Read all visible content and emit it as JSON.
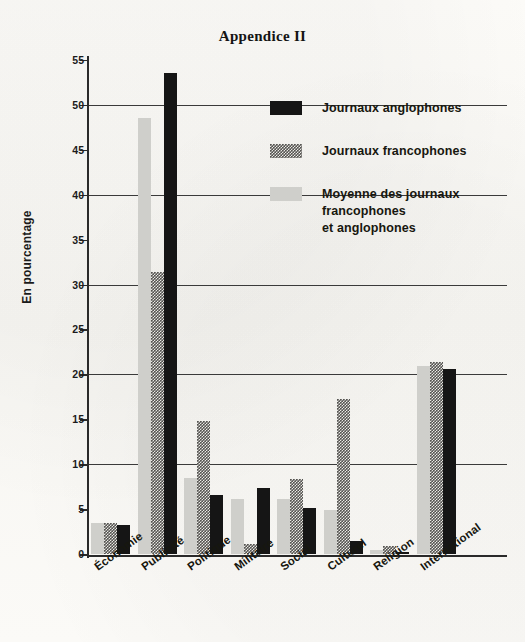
{
  "title": "Appendice II",
  "legend": {
    "position": "top-right",
    "items": [
      {
        "key": "anglo",
        "label": "Journaux anglophones",
        "color": "#151515",
        "swatch": "solid-dark"
      },
      {
        "key": "franco",
        "label": "Journaux francophones",
        "color": "#555451",
        "swatch": "checkered"
      },
      {
        "key": "moyenne",
        "label": "Moyenne des journaux\nfrancophones\net anglophones",
        "label_lines": [
          "Moyenne des journaux",
          "francophones",
          "et anglophones"
        ],
        "color": "#cfcfcb",
        "swatch": "solid-light"
      }
    ]
  },
  "chart_data": {
    "type": "bar",
    "title": "Appendice II",
    "xlabel": "",
    "ylabel": "En pourcentage",
    "ylim": [
      0,
      55
    ],
    "ytick_step": 5,
    "yticks": [
      0,
      5,
      10,
      15,
      20,
      25,
      30,
      35,
      40,
      45,
      50,
      55
    ],
    "gridlines": [
      10,
      20,
      30,
      40,
      50
    ],
    "grid": true,
    "legend_position": "top-right",
    "bar_order_in_group": [
      "Moyenne des journaux francophones et anglophones",
      "Journaux francophones",
      "Journaux anglophones"
    ],
    "categories": [
      "Économie",
      "Publicité",
      "Politique",
      "Militaire",
      "Social",
      "Culturel",
      "Religion",
      "International"
    ],
    "series": [
      {
        "name": "Moyenne des journaux francophones et anglophones",
        "color": "#cfcfcb",
        "values": [
          3.4,
          48.5,
          8.5,
          6.1,
          6.1,
          4.9,
          0.4,
          20.9
        ]
      },
      {
        "name": "Journaux francophones",
        "color": "#555451",
        "values": [
          3.5,
          31.4,
          14.8,
          1.1,
          8.4,
          17.3,
          0.9,
          21.4
        ]
      },
      {
        "name": "Journaux anglophones",
        "color": "#151515",
        "values": [
          3.2,
          53.5,
          6.6,
          7.4,
          5.1,
          1.5,
          0.2,
          20.6
        ]
      }
    ]
  }
}
